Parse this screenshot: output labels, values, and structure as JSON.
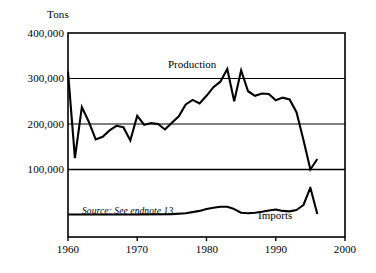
{
  "chart_data": {
    "type": "line",
    "title": "",
    "xlabel": "",
    "ylabel": "Tons",
    "ylim": [
      0,
      400000
    ],
    "xlim": [
      1960,
      2000
    ],
    "grid": true,
    "gridlines_y": [
      100000,
      200000,
      300000
    ],
    "legend": "inline-annotations",
    "ytick_labels": [
      "400,000",
      "300,000",
      "200,000",
      "100,000"
    ],
    "ytick_values": [
      400000,
      300000,
      200000,
      100000
    ],
    "xtick_labels": [
      "1960",
      "1970",
      "1980",
      "1990",
      "2000"
    ],
    "xtick_values": [
      1960,
      1970,
      1980,
      1990,
      2000
    ],
    "annotations": [
      {
        "name": "production-label",
        "text": "Production",
        "x": 1982,
        "y": 352000
      },
      {
        "name": "imports-label",
        "text": "Imports",
        "x": 1990,
        "y": 42000
      },
      {
        "name": "source-note",
        "text": "Source: See endnote 13",
        "x": 1963,
        "y": 45000
      }
    ],
    "series": [
      {
        "name": "Production",
        "x": [
          1960,
          1961,
          1962,
          1963,
          1964,
          1965,
          1966,
          1967,
          1968,
          1969,
          1970,
          1971,
          1972,
          1973,
          1974,
          1975,
          1976,
          1977,
          1978,
          1979,
          1980,
          1981,
          1982,
          1983,
          1984,
          1985,
          1986,
          1987,
          1988,
          1989,
          1990,
          1991,
          1992,
          1993,
          1994,
          1995,
          1996
        ],
        "values": [
          315000,
          125000,
          237000,
          205000,
          166000,
          172000,
          186000,
          196000,
          193000,
          164000,
          218000,
          198000,
          202000,
          200000,
          188000,
          203000,
          217000,
          243000,
          253000,
          245000,
          262000,
          281000,
          293000,
          321000,
          250000,
          318000,
          272000,
          262000,
          267000,
          266000,
          252000,
          258000,
          254000,
          226000,
          165000,
          100000,
          123000
        ]
      },
      {
        "name": "Imports",
        "x": [
          1960,
          1965,
          1970,
          1975,
          1977,
          1979,
          1980,
          1981,
          1982,
          1983,
          1984,
          1985,
          1986,
          1987,
          1988,
          1989,
          1990,
          1991,
          1992,
          1993,
          1994,
          1995,
          1996
        ],
        "values": [
          1000,
          1000,
          1000,
          2000,
          4000,
          9000,
          13000,
          16000,
          18000,
          18000,
          13000,
          5000,
          4000,
          5000,
          7000,
          10000,
          12000,
          9000,
          8000,
          11000,
          22000,
          60000,
          2000
        ]
      }
    ]
  }
}
